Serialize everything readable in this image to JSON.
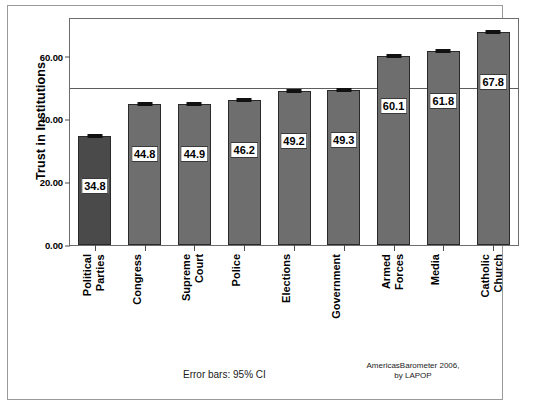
{
  "chart_data": {
    "type": "bar",
    "title": "",
    "xlabel": "",
    "ylabel": "Trust in Institutions",
    "ylim": [
      0,
      72
    ],
    "yticks": [
      0,
      20,
      40,
      60
    ],
    "ytick_labels": [
      "0.00",
      "20.00",
      "40.00",
      "60.00"
    ],
    "grid": false,
    "legend": null,
    "reference_line": 50,
    "categories": [
      "Political Parties",
      "Congress",
      "Supreme Court",
      "Police",
      "Elections",
      "Government",
      "Armed Forces",
      "Media",
      "Catholic Church"
    ],
    "category_lines": [
      [
        "Political",
        "Parties"
      ],
      [
        "Congress"
      ],
      [
        "Supreme",
        "Court"
      ],
      [
        "Police"
      ],
      [
        "Elections"
      ],
      [
        "Government"
      ],
      [
        "Armed",
        "Forces"
      ],
      [
        "Media"
      ],
      [
        "Catholic",
        "Church"
      ]
    ],
    "values": [
      34.8,
      44.8,
      44.9,
      46.2,
      49.2,
      49.3,
      60.1,
      61.8,
      67.8
    ],
    "value_labels": [
      "34.8",
      "44.8",
      "44.9",
      "46.2",
      "49.2",
      "49.3",
      "60.1",
      "61.8",
      "67.8"
    ],
    "error_bars": {
      "type": "95% CI",
      "lower": [
        34.0,
        44.1,
        44.2,
        45.5,
        48.4,
        48.6,
        59.2,
        60.9,
        67.0
      ],
      "upper": [
        35.6,
        45.5,
        45.6,
        46.9,
        50.0,
        50.0,
        61.0,
        62.7,
        68.6
      ]
    },
    "bar_colors": [
      "#4a4a4a",
      "#6e6e6e",
      "#6e6e6e",
      "#6e6e6e",
      "#6e6e6e",
      "#6e6e6e",
      "#6e6e6e",
      "#6e6e6e",
      "#6e6e6e"
    ]
  },
  "footnotes": {
    "error_bars": "Error bars: 95% CI",
    "source_line1": "AmericasBarometer 2006,",
    "source_line2": "by LAPOP"
  }
}
